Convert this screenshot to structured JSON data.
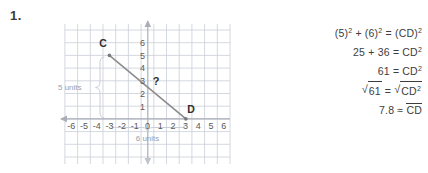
{
  "problem": {
    "number": "1."
  },
  "graph": {
    "x_axis": {
      "labels": [
        "-6",
        "-5",
        "-4",
        "-3",
        "-2",
        "-1",
        "0",
        "1",
        "2",
        "3",
        "4",
        "5",
        "6"
      ],
      "min": -6,
      "max": 6,
      "arrow_direction": "left"
    },
    "y_axis": {
      "labels": [
        "1",
        "2",
        "3",
        "4",
        "5",
        "6"
      ],
      "min": 0,
      "max": 6,
      "arrow_direction": "up"
    },
    "points": [
      {
        "label": "C",
        "x": -3,
        "y": 5
      },
      {
        "label": "D",
        "x": 3,
        "y": 0
      }
    ],
    "segment": {
      "from": "C",
      "to": "D",
      "color": "#8c8c8c"
    },
    "unknown_marker": "?",
    "braces": [
      {
        "label": "5 units",
        "orientation": "vertical"
      },
      {
        "label": "6 units",
        "orientation": "horizontal"
      }
    ],
    "grid_color": "#c9ced8",
    "axis_color": "#a9aeb8"
  },
  "equations": [
    {
      "id": "line1",
      "parts": [
        "(5)",
        "2",
        " + (6)",
        "2",
        " = (CD)",
        "2"
      ]
    },
    {
      "id": "line2",
      "text": "25 + 36 = CD",
      "sup": "2"
    },
    {
      "id": "line3",
      "text": "61 = CD",
      "sup": "2"
    },
    {
      "id": "line4",
      "left": "61",
      "right": "CD",
      "right_sup": "2"
    },
    {
      "id": "line5",
      "value": "7.8",
      "relation": "≈",
      "segment": "CD"
    }
  ],
  "colors": {
    "text": "#3d3d3d",
    "grid": "#c9ced8",
    "line": "#8c8c8c"
  }
}
